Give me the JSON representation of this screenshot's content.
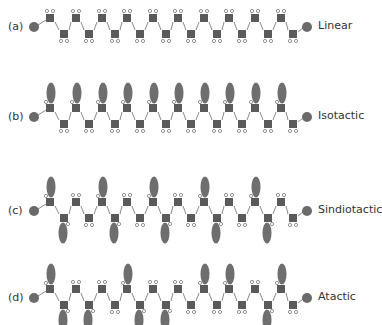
{
  "diagram": {
    "colors": {
      "backbone_square": "#5a5a5a",
      "end_group": "#6a6a6a",
      "side_group": "#6e6e6e",
      "bond": "#8a8a8a",
      "hydrogen_stroke": "#777777"
    },
    "chain": {
      "top_x": [
        50,
        76,
        102,
        127,
        153,
        178,
        204,
        229,
        255,
        281
      ],
      "bottom_x": [
        64,
        89,
        115,
        140,
        166,
        191,
        217,
        242,
        268,
        293
      ],
      "start_circle_x": 34,
      "end_circle_x": 307
    },
    "rows": [
      {
        "id": "a",
        "letter": "(a)",
        "name": "Linear",
        "center_y": 27,
        "top_substituted": [
          false,
          false,
          false,
          false,
          false,
          false,
          false,
          false,
          false,
          false
        ],
        "bottom_substituted": [
          false,
          false,
          false,
          false,
          false,
          false,
          false,
          false,
          false,
          false
        ]
      },
      {
        "id": "b",
        "letter": "(b)",
        "name": "Isotactic",
        "center_y": 117,
        "top_substituted": [
          true,
          true,
          true,
          true,
          true,
          true,
          true,
          true,
          true,
          true
        ],
        "bottom_substituted": [
          false,
          false,
          false,
          false,
          false,
          false,
          false,
          false,
          false,
          false
        ]
      },
      {
        "id": "c",
        "letter": "(c)",
        "name": "Sindiotactic",
        "center_y": 211,
        "top_substituted": [
          true,
          false,
          true,
          false,
          true,
          false,
          true,
          false,
          true,
          false
        ],
        "bottom_substituted": [
          true,
          false,
          true,
          false,
          true,
          false,
          true,
          false,
          true,
          false
        ]
      },
      {
        "id": "d",
        "letter": "(d)",
        "name": "Atactic",
        "center_y": 298,
        "top_substituted": [
          true,
          false,
          false,
          true,
          false,
          false,
          true,
          true,
          false,
          true
        ],
        "bottom_substituted": [
          true,
          true,
          false,
          true,
          true,
          false,
          false,
          false,
          true,
          false
        ]
      }
    ]
  }
}
